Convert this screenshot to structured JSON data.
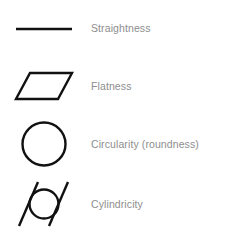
{
  "diagram": {
    "background_color": "#ffffff",
    "symbol_stroke_color": "#111111",
    "label_text_color": "#8e8e8e",
    "rows": [
      {
        "symbol_name": "straightness-symbol",
        "symbol_glyph": "horizontal-line",
        "label": "Straightness"
      },
      {
        "symbol_name": "flatness-symbol",
        "symbol_glyph": "parallelogram",
        "label": "Flatness"
      },
      {
        "symbol_name": "circularity-symbol",
        "symbol_glyph": "circle",
        "label": "Circularity (roundness)"
      },
      {
        "symbol_name": "cylindricity-symbol",
        "symbol_glyph": "circle-with-two-parallel-diagonal-lines",
        "label": "Cylindricity"
      }
    ]
  }
}
